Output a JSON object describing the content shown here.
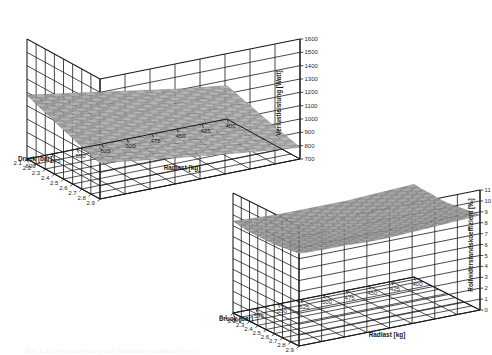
{
  "figure": {
    "background_color": "#ffffff",
    "line_color": "#1a1a1a",
    "mesh_color": "#4a4a4a",
    "partial_caption": "Bild 5.12: Verlustleistung und Rollwiderstandskoeffizient"
  },
  "charts": [
    {
      "id": "verlustleistung-surface",
      "name": "chart-verlustleistung",
      "x_label": "Druck [bar]",
      "y_label": "Radlast [kg]",
      "z_label": "Verlustleistung [Watt]",
      "x_ticks": [
        "2.1",
        "2.2",
        "2.3",
        "2.4",
        "2.5",
        "2.6",
        "2.7",
        "2.8",
        "2.9"
      ],
      "y_ticks": [
        "600",
        "575",
        "550",
        "525",
        "500",
        "475",
        "450",
        "425",
        "400"
      ],
      "z_ticks": [
        "1600",
        "1500",
        "1400",
        "1300",
        "1200",
        "1100",
        "1000",
        "900",
        "800",
        "700"
      ]
    },
    {
      "id": "rollwiderstand-surface",
      "name": "chart-rollwiderstandskoeffizient",
      "x_label": "Druck [bar]",
      "y_label": "Radlast [kg]",
      "z_label": "Rollwiderstandskoeffizient [‰]",
      "x_ticks": [
        "2.1",
        "2.2",
        "2.3",
        "2.4",
        "2.5",
        "2.6",
        "2.7",
        "2.8",
        "2.9"
      ],
      "y_ticks": [
        "600",
        "575",
        "550",
        "525",
        "500",
        "475",
        "450",
        "425",
        "400"
      ],
      "z_ticks": [
        "11",
        "10",
        "9",
        "8",
        "7",
        "6",
        "5",
        "4",
        "3",
        "2",
        "1",
        "0"
      ]
    }
  ],
  "chart_data": [
    {
      "type": "surface",
      "title": "",
      "id": "verlustleistung-surface",
      "xlabel": "Druck [bar]",
      "ylabel": "Radlast [kg]",
      "zlabel": "Verlustleistung [Watt]",
      "x": [
        2.1,
        2.2,
        2.3,
        2.4,
        2.5,
        2.6,
        2.7,
        2.8,
        2.9
      ],
      "y": [
        600,
        575,
        550,
        525,
        500,
        475,
        450,
        425,
        400
      ],
      "xlim": [
        2.1,
        2.9
      ],
      "ylim": [
        400,
        600
      ],
      "zlim": [
        700,
        1600
      ],
      "grid": true,
      "legend": "none",
      "z": [
        [
          1180,
          1150,
          1120,
          1090,
          1060,
          1030,
          1000,
          975,
          950
        ],
        [
          1150,
          1120,
          1092,
          1063,
          1034,
          1005,
          978,
          953,
          928
        ],
        [
          1122,
          1093,
          1065,
          1037,
          1008,
          980,
          954,
          930,
          906
        ],
        [
          1095,
          1067,
          1039,
          1011,
          984,
          957,
          931,
          908,
          885
        ],
        [
          1068,
          1041,
          1014,
          987,
          960,
          934,
          909,
          886,
          864
        ],
        [
          1042,
          1015,
          989,
          963,
          937,
          912,
          888,
          866,
          844
        ],
        [
          1017,
          991,
          965,
          940,
          915,
          890,
          867,
          846,
          825
        ],
        [
          993,
          967,
          942,
          917,
          893,
          869,
          847,
          826,
          806
        ],
        [
          970,
          945,
          920,
          896,
          872,
          849,
          828,
          807,
          788
        ]
      ]
    },
    {
      "type": "surface",
      "title": "",
      "id": "rollwiderstand-surface",
      "xlabel": "Druck [bar]",
      "ylabel": "Radlast [kg]",
      "zlabel": "Rollwiderstandskoeffizient [‰]",
      "x": [
        2.1,
        2.2,
        2.3,
        2.4,
        2.5,
        2.6,
        2.7,
        2.8,
        2.9
      ],
      "y": [
        600,
        575,
        550,
        525,
        500,
        475,
        450,
        425,
        400
      ],
      "xlim": [
        2.1,
        2.9
      ],
      "ylim": [
        400,
        600
      ],
      "zlim": [
        0,
        11
      ],
      "grid": true,
      "legend": "none",
      "z": [
        [
          8.4,
          8.3,
          8.2,
          8.2,
          8.2,
          8.2,
          8.3,
          8.4,
          8.5
        ],
        [
          8.3,
          8.2,
          8.1,
          8.0,
          8.0,
          8.1,
          8.2,
          8.3,
          8.4
        ],
        [
          8.2,
          8.1,
          8.0,
          7.9,
          7.9,
          8.0,
          8.1,
          8.2,
          8.4
        ],
        [
          8.2,
          8.0,
          7.9,
          7.8,
          7.8,
          7.9,
          8.0,
          8.2,
          8.3
        ],
        [
          8.2,
          8.0,
          7.9,
          7.8,
          7.8,
          7.9,
          8.0,
          8.2,
          8.3
        ],
        [
          8.2,
          8.1,
          8.0,
          7.9,
          7.9,
          8.0,
          8.1,
          8.2,
          8.4
        ],
        [
          8.3,
          8.2,
          8.1,
          8.0,
          8.0,
          8.1,
          8.2,
          8.3,
          8.5
        ],
        [
          8.4,
          8.3,
          8.2,
          8.2,
          8.2,
          8.2,
          8.3,
          8.5,
          8.6
        ],
        [
          8.5,
          8.4,
          8.4,
          8.3,
          8.3,
          8.4,
          8.5,
          8.6,
          8.7
        ]
      ]
    }
  ]
}
